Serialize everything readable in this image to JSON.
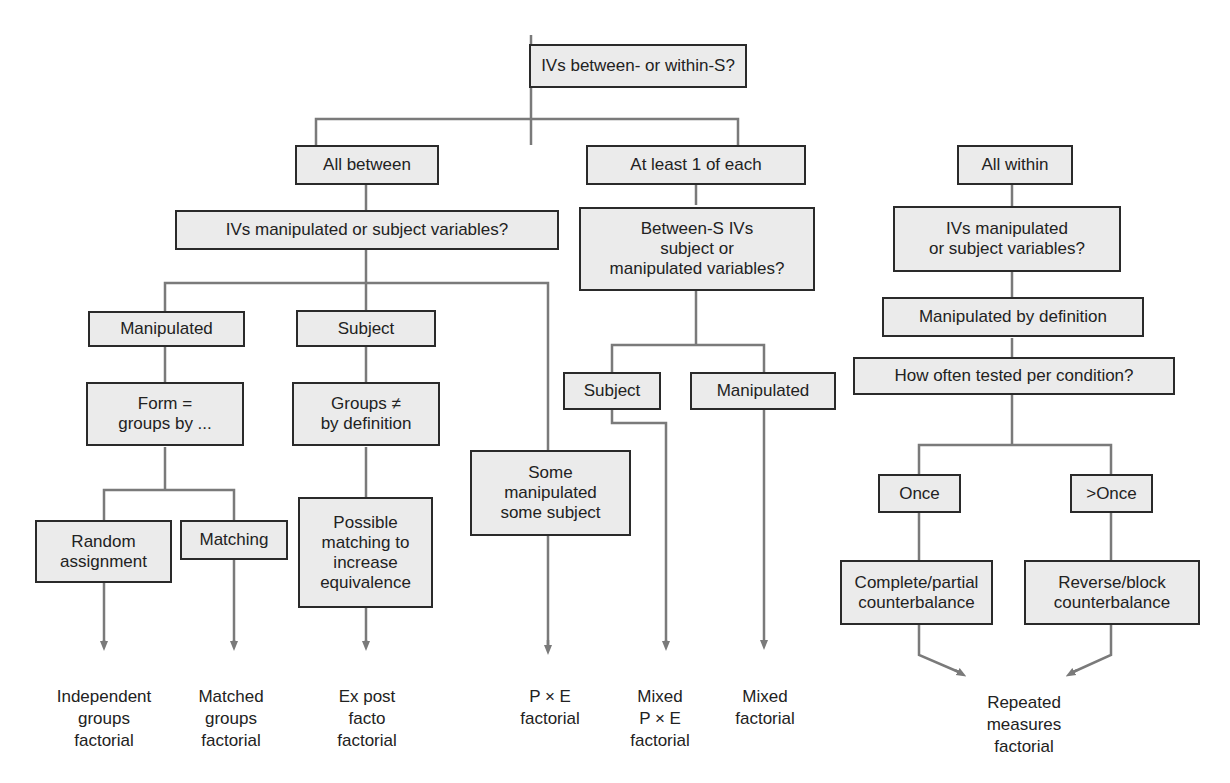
{
  "diagram": {
    "type": "decision-tree",
    "colors": {
      "box_fill": "#ebebeb",
      "box_border": "#2a2a2a",
      "connector": "#7a7a7a",
      "text": "#222222"
    },
    "nodes": {
      "root": "IVs between- or within-S?",
      "all_between": "All between",
      "at_least_one": "At least 1 of each",
      "all_within": "All within",
      "between_question": "IVs manipulated or subject variables?",
      "mixed_question": "Between-S IVs\nsubject or\nmanipulated variables?",
      "within_question": "IVs manipulated\nor subject variables?",
      "between_manipulated": "Manipulated",
      "between_subject": "Subject",
      "form_groups": "Form =\ngroups by ...",
      "groups_not_equal": "Groups ≠\nby definition",
      "some_manipulated": "Some\nmanipulated\nsome subject",
      "random_assignment": "Random\nassignment",
      "matching": "Matching",
      "possible_matching": "Possible\nmatching to\nincrease\nequivalence",
      "mixed_subject": "Subject",
      "mixed_manipulated": "Manipulated",
      "manipulated_by_definition": "Manipulated by definition",
      "how_often": "How often tested per condition?",
      "once": "Once",
      "more_than_once": ">Once",
      "complete_partial": "Complete/partial\ncounterbalance",
      "reverse_block": "Reverse/block\ncounterbalance"
    },
    "outcomes": {
      "independent_groups": "Independent\ngroups\nfactorial",
      "matched_groups": "Matched\ngroups\nfactorial",
      "ex_post_facto": "Ex post\nfacto\nfactorial",
      "pxe": "P × E\nfactorial",
      "mixed_pxe": "Mixed\nP × E\nfactorial",
      "mixed": "Mixed\nfactorial",
      "repeated_measures": "Repeated\nmeasures\nfactorial"
    }
  }
}
